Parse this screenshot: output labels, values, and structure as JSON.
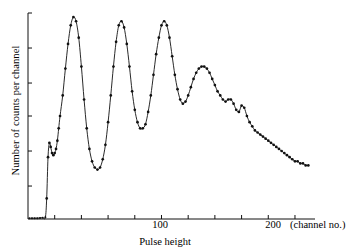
{
  "figure": {
    "background": "#ffffff",
    "ink_color": "#111111"
  },
  "chart_data": {
    "type": "scatter",
    "title": "",
    "subtitle": "",
    "xlabel": "Pulse height",
    "ylabel": "Number of counts per channel",
    "x_unit_note": "(channel no.)",
    "xlim": [
      0,
      215
    ],
    "ylim": [
      0,
      100
    ],
    "grid": false,
    "legend": null,
    "marker": "filled-circle",
    "line": "smooth-solid",
    "xticks": [
      20,
      40,
      60,
      80,
      100,
      120,
      140,
      160,
      180,
      200
    ],
    "xticklabels": [
      "",
      "",
      "",
      "",
      "100",
      "",
      "",
      "",
      "",
      "200"
    ],
    "yticks": [
      0,
      16,
      33,
      50,
      66,
      83,
      100
    ],
    "yticklabels": [
      "",
      "",
      "",
      "",
      "",
      "",
      ""
    ],
    "series": [
      {
        "name": "counts per channel",
        "x": [
          1,
          3,
          5,
          7,
          9,
          11,
          13,
          14,
          15,
          16,
          17,
          18,
          19,
          20,
          21,
          22,
          23,
          24,
          26,
          28,
          30,
          32,
          34,
          36,
          38,
          40,
          42,
          44,
          46,
          48,
          50,
          52,
          54,
          56,
          58,
          60,
          62,
          64,
          66,
          68,
          70,
          72,
          74,
          76,
          78,
          80,
          82,
          84,
          86,
          88,
          90,
          92,
          94,
          96,
          98,
          100,
          102,
          104,
          106,
          108,
          110,
          112,
          114,
          116,
          118,
          120,
          122,
          124,
          126,
          128,
          130,
          132,
          134,
          136,
          138,
          140,
          142,
          144,
          146,
          148,
          150,
          152,
          154,
          156,
          158,
          160,
          162,
          164,
          166,
          168,
          170,
          172,
          174,
          176,
          178,
          180,
          182,
          184,
          186,
          188,
          190,
          192,
          194,
          196,
          198,
          200,
          202,
          204,
          206,
          208,
          210
        ],
        "y": [
          0.4,
          0.4,
          0.4,
          0.4,
          0.5,
          0.6,
          0.8,
          10,
          30,
          37,
          35,
          32,
          31,
          32,
          34,
          38,
          44,
          50,
          60,
          73,
          85,
          94,
          98,
          96,
          88,
          74,
          58,
          44,
          34,
          28,
          25,
          24,
          25,
          29,
          36,
          47,
          60,
          74,
          86,
          94,
          96,
          93,
          85,
          74,
          62,
          53,
          47,
          44,
          44,
          46,
          52,
          60,
          70,
          80,
          88,
          94,
          96,
          94,
          88,
          79,
          70,
          63,
          58,
          56,
          57,
          60,
          64,
          68,
          71,
          73,
          74,
          74,
          73,
          71,
          68,
          65,
          62,
          60,
          58,
          57,
          58,
          58,
          56,
          53,
          52,
          55,
          54,
          50,
          47,
          45,
          43,
          42,
          41,
          40,
          39,
          38,
          37,
          36,
          35,
          34,
          33,
          32,
          31,
          30,
          29,
          28,
          28,
          27,
          27,
          26,
          26
        ],
        "color": "#111111"
      }
    ],
    "annotations": []
  },
  "axis_labels": {
    "x_title": "Pulse height",
    "y_title": "Number of counts per channel",
    "x_tick_100": "100",
    "x_tick_200": "200",
    "x_unit": "(channel no.)"
  }
}
